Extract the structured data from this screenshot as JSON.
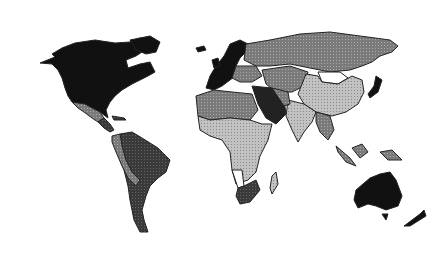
{
  "map": {
    "type": "choropleth",
    "projection": "world, equirectangular-like",
    "background": "#ffffff",
    "border_color": "#222222",
    "shade_levels": {
      "black": "#111111",
      "dark": "#3a3a3a",
      "medium": "#777777",
      "light": "#b5b5b5",
      "white": "#ffffff"
    },
    "regions": [
      {
        "name": "North America (USA, Canada)",
        "shade": "black"
      },
      {
        "name": "Greenland",
        "shade": "black"
      },
      {
        "name": "Mexico",
        "shade": "medium"
      },
      {
        "name": "Central America / Caribbean",
        "shade": "dark"
      },
      {
        "name": "Brazil / Venezuela / Guyana",
        "shade": "dark"
      },
      {
        "name": "Colombia / Ecuador / Peru",
        "shade": "medium"
      },
      {
        "name": "Bolivia",
        "shade": "medium"
      },
      {
        "name": "Argentina / Chile / Paraguay / Uruguay",
        "shade": "dark"
      },
      {
        "name": "Western Europe / Scandinavia",
        "shade": "black"
      },
      {
        "name": "Eastern Europe",
        "shade": "medium"
      },
      {
        "name": "Russia",
        "shade": "medium"
      },
      {
        "name": "Central Asia",
        "shade": "medium"
      },
      {
        "name": "Mongolia",
        "shade": "white"
      },
      {
        "name": "China",
        "shade": "light"
      },
      {
        "name": "India",
        "shade": "light"
      },
      {
        "name": "Southeast Asia",
        "shade": "medium"
      },
      {
        "name": "Japan",
        "shade": "black"
      },
      {
        "name": "Middle East / Saudi Arabia",
        "shade": "dark"
      },
      {
        "name": "North Africa",
        "shade": "medium"
      },
      {
        "name": "Sub-Saharan Africa",
        "shade": "light"
      },
      {
        "name": "Namibia",
        "shade": "white"
      },
      {
        "name": "South Africa",
        "shade": "dark"
      },
      {
        "name": "Madagascar",
        "shade": "light"
      },
      {
        "name": "Indonesia / Papua",
        "shade": "medium"
      },
      {
        "name": "Australia",
        "shade": "black"
      },
      {
        "name": "New Zealand",
        "shade": "black"
      }
    ]
  }
}
